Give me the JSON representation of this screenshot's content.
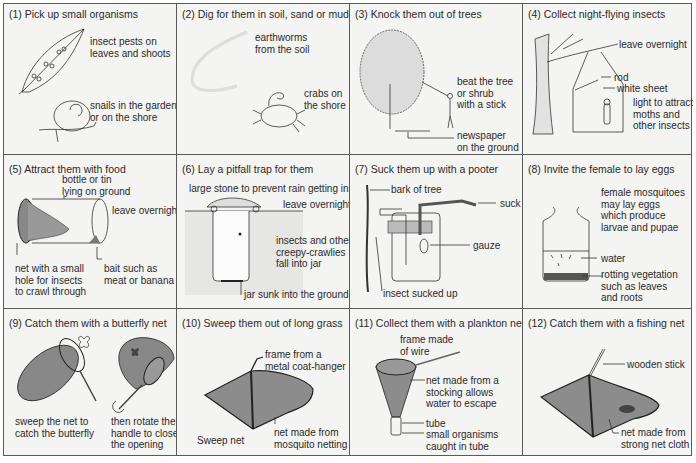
{
  "panels": [
    {
      "title": "(1) Pick up small organisms",
      "labels": [
        "insect pests on\nleaves and shoots",
        "snails in the garden\nor on the shore"
      ]
    },
    {
      "title": "(2) Dig for them in soil, sand or mud",
      "labels": [
        "earthworms\nfrom the soil",
        "crabs on\nthe shore"
      ]
    },
    {
      "title": "(3) Knock them out of trees",
      "labels": [
        "beat the tree\nor shrub\nwith a stick",
        "newspaper\non the ground"
      ]
    },
    {
      "title": "(4) Collect night-flying insects",
      "labels": [
        "leave overnight",
        "rod",
        "white sheet",
        "light to attract\nmoths and\nother insects"
      ]
    },
    {
      "title": "(5) Attract them with food",
      "labels": [
        "bottle or tin\nlying on ground",
        "leave overnight",
        "net with a small\nhole for insects\nto crawl through",
        "bait such as\nmeat or banana"
      ]
    },
    {
      "title": "(6) Lay a pitfall trap for them",
      "labels": [
        "large stone to prevent rain getting in",
        "leave overnight",
        "insects and other\ncreepy-crawlies\nfall into jar",
        "jar sunk into the ground"
      ]
    },
    {
      "title": "(7) Suck them up with a pooter",
      "labels": [
        "bark of tree",
        "suck",
        "gauze",
        "insect sucked up"
      ]
    },
    {
      "title": "(8) Invite the female to lay eggs",
      "labels": [
        "female mosquitoes\nmay lay eggs\nwhich produce\nlarvae and pupae",
        "water",
        "rotting vegetation\nsuch as leaves\nand roots"
      ]
    },
    {
      "title": "(9) Catch them with a butterfly net",
      "labels": [
        "sweep the net to\ncatch the butterfly",
        "then rotate the\nhandle to close\nthe opening"
      ]
    },
    {
      "title": "(10) Sweep them out of long grass",
      "labels": [
        "frame from a\nmetal coat-hanger",
        "Sweep net",
        "net made from\nmosquito netting"
      ]
    },
    {
      "title": "(11) Collect them with a plankton net",
      "labels": [
        "frame made\nof wire",
        "net made from a\nstocking allows\nwater to escape",
        "tube",
        "small organisms\ncaught in tube"
      ]
    },
    {
      "title": "(12) Catch them with a fishing net",
      "labels": [
        "wooden stick",
        "net made from\nstrong net cloth"
      ]
    }
  ]
}
